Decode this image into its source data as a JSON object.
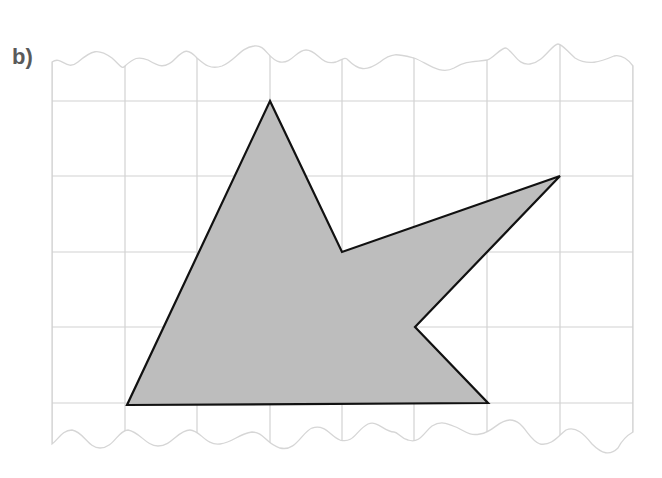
{
  "figure": {
    "label": "b)",
    "grid": {
      "columns": 8,
      "rows_full": 4,
      "x_lines": [
        52,
        125,
        197,
        270,
        342,
        414,
        487,
        560,
        633
      ],
      "y_lines": [
        101,
        176,
        252,
        327,
        403
      ],
      "line_color": "#d2d2d2",
      "top_edge_y": 30,
      "bottom_edge_y": 455
    },
    "shape": {
      "name": "irregular hexagon",
      "fill": "#bdbdbd",
      "stroke": "#111111",
      "vertices_grid": [
        [
          3,
          0
        ],
        [
          4,
          2
        ],
        [
          7,
          1
        ],
        [
          5,
          3
        ],
        [
          6,
          4
        ],
        [
          1,
          4
        ]
      ],
      "vertices_px": [
        [
          270,
          101
        ],
        [
          342,
          252
        ],
        [
          560,
          176
        ],
        [
          415,
          327
        ],
        [
          488,
          403
        ],
        [
          127,
          405
        ]
      ]
    }
  }
}
